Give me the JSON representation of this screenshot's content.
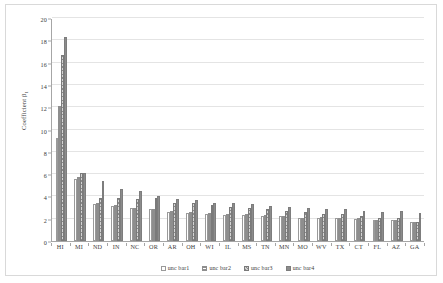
{
  "chart_data": {
    "type": "bar",
    "title": "",
    "xlabel": "",
    "ylabel": "Coefficient β",
    "ylabel_sub": "1",
    "ylim": [
      0,
      20
    ],
    "yticks": [
      0,
      2,
      4,
      6,
      8,
      10,
      12,
      14,
      16,
      18,
      20
    ],
    "ytick_labels": [
      "0",
      "2",
      "4",
      "6",
      "8",
      "10",
      "12",
      "14",
      "16",
      "18",
      "20"
    ],
    "grid": true,
    "legend_position": "bottom",
    "categories": [
      "HI",
      "MI",
      "ND",
      "IN",
      "NC",
      "OR",
      "AR",
      "OH",
      "WI",
      "IL",
      "MS",
      "TN",
      "MN",
      "MO",
      "WV",
      "TX",
      "CT",
      "FL",
      "AZ",
      "GA"
    ],
    "series": [
      {
        "name": "unc bar1",
        "color": "#ffffff",
        "values": [
          9.2,
          5.6,
          3.3,
          3.15,
          3.0,
          2.85,
          2.6,
          2.55,
          2.45,
          2.35,
          2.35,
          2.25,
          2.2,
          2.05,
          2.1,
          2.05,
          2.0,
          1.9,
          1.85,
          1.75
        ]
      },
      {
        "name": "unc bar2",
        "color": "#fdfdfd",
        "values": [
          12.1,
          5.7,
          3.45,
          3.2,
          3.0,
          2.9,
          2.65,
          2.6,
          2.5,
          2.4,
          2.4,
          2.3,
          2.25,
          2.1,
          2.15,
          2.1,
          2.05,
          1.9,
          1.85,
          1.75
        ]
      },
      {
        "name": "unc bar3",
        "color": "#d4d4d4",
        "values": [
          16.7,
          6.1,
          3.9,
          3.85,
          3.8,
          3.85,
          3.4,
          3.45,
          3.2,
          3.05,
          2.95,
          2.85,
          2.7,
          2.6,
          2.45,
          2.4,
          2.2,
          2.1,
          2.05,
          1.75
        ]
      },
      {
        "name": "unc bar4",
        "color": "#8c8c8c",
        "values": [
          18.3,
          6.1,
          5.35,
          4.65,
          4.5,
          4.0,
          3.8,
          3.65,
          3.45,
          3.4,
          3.3,
          3.15,
          3.05,
          2.95,
          2.85,
          2.85,
          2.7,
          2.6,
          2.65,
          2.55
        ]
      }
    ]
  }
}
